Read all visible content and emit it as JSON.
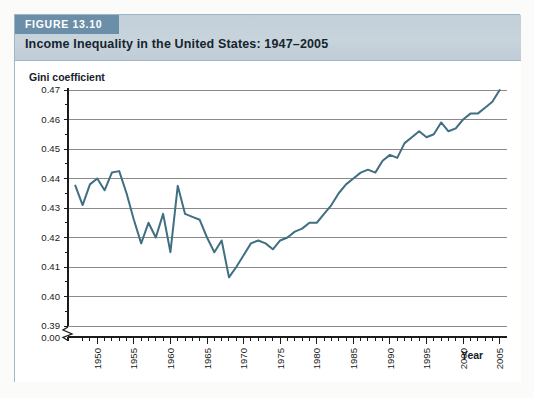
{
  "figure": {
    "tag": "FIGURE 13.10",
    "title": "Income Inequality in the United States: 1947–2005"
  },
  "colors": {
    "tag_background": "#6b8fa8",
    "header_background": "#c5d1da",
    "line": "#3f6f80",
    "gridline": "#8a8a8a",
    "axis": "#1b1b1b",
    "panel": "#ffffff",
    "frame_border": "#9fb6c4"
  },
  "chart_data": {
    "type": "line",
    "title": "Income Inequality in the United States: 1947–2005",
    "xlabel": "Year",
    "ylabel": "Gini coefficient",
    "xlim": [
      1946,
      2006
    ],
    "ylim": [
      0.39,
      0.47
    ],
    "grid": true,
    "legend": "none",
    "axis_break": "0.00",
    "ytick_labels": [
      "0.47",
      "0.46",
      "0.45",
      "0.44",
      "0.43",
      "0.42",
      "0.41",
      "0.40",
      "0.39",
      "0.00"
    ],
    "ytick_values": [
      0.47,
      0.46,
      0.45,
      0.44,
      0.43,
      0.42,
      0.41,
      0.4,
      0.39
    ],
    "xtick_labels": [
      "1950",
      "1955",
      "1960",
      "1965",
      "1970",
      "1975",
      "1980",
      "1985",
      "1990",
      "1995",
      "2000",
      "2005"
    ],
    "xtick_values": [
      1950,
      1955,
      1960,
      1965,
      1970,
      1975,
      1980,
      1985,
      1990,
      1995,
      2000,
      2005
    ],
    "xtick_minor_step": 1,
    "series": [
      {
        "name": "Gini coefficient",
        "x": [
          1947,
          1948,
          1949,
          1950,
          1951,
          1952,
          1953,
          1954,
          1955,
          1956,
          1957,
          1958,
          1959,
          1960,
          1961,
          1962,
          1963,
          1964,
          1965,
          1966,
          1967,
          1968,
          1969,
          1970,
          1971,
          1972,
          1973,
          1974,
          1975,
          1976,
          1977,
          1978,
          1979,
          1980,
          1981,
          1982,
          1983,
          1984,
          1985,
          1986,
          1987,
          1988,
          1989,
          1990,
          1991,
          1992,
          1993,
          1994,
          1995,
          1996,
          1997,
          1998,
          1999,
          2000,
          2001,
          2002,
          2003,
          2004,
          2005
        ],
        "values": [
          0.4376,
          0.431,
          0.438,
          0.44,
          0.436,
          0.442,
          0.4425,
          0.435,
          0.426,
          0.418,
          0.425,
          0.42,
          0.428,
          0.415,
          0.4375,
          0.428,
          0.427,
          0.426,
          0.42,
          0.415,
          0.419,
          0.4065,
          0.41,
          0.414,
          0.418,
          0.419,
          0.418,
          0.416,
          0.419,
          0.42,
          0.422,
          0.423,
          0.425,
          0.425,
          0.428,
          0.431,
          0.435,
          0.438,
          0.44,
          0.442,
          0.443,
          0.442,
          0.446,
          0.448,
          0.447,
          0.452,
          0.454,
          0.456,
          0.454,
          0.455,
          0.459,
          0.456,
          0.457,
          0.46,
          0.462,
          0.462,
          0.464,
          0.466,
          0.47
        ]
      }
    ]
  }
}
